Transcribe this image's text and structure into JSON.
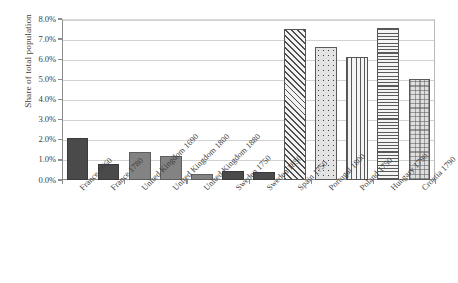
{
  "chart_data": {
    "type": "bar",
    "title": "",
    "xlabel": "",
    "ylabel": "Share of total population",
    "ylim": [
      0,
      8
    ],
    "ytick_labels": [
      "0.0%",
      "1.0%",
      "2.0%",
      "3.0%",
      "4.0%",
      "5.0%",
      "6.0%",
      "7.0%",
      "8.0%"
    ],
    "ytick_values": [
      0,
      1,
      2,
      3,
      4,
      5,
      6,
      7,
      8
    ],
    "grid": true,
    "legend": "none",
    "units": "percent",
    "categories": [
      "France 1660",
      "France 1780",
      "United Kingdom 1690",
      "United Kingdom 1800",
      "United Kingdom 1880",
      "Sweden 1750",
      "Sweden 1850",
      "Spain 1750",
      "Portugal 1800",
      "Poland 1750",
      "Hungary 1790",
      "Croatia 1790"
    ],
    "values": [
      2.1,
      0.8,
      1.4,
      1.2,
      0.3,
      0.45,
      0.4,
      7.5,
      6.6,
      6.1,
      7.55,
      5.0
    ],
    "bar_patterns": [
      "solid-dark-gray",
      "solid-dark-gray",
      "solid-mid-gray",
      "solid-mid-gray",
      "solid-mid-gray",
      "solid-dark-gray",
      "solid-dark-gray",
      "diagonal-hatch",
      "dotted",
      "vertical-lines",
      "horizontal-lines",
      "speckled-dots"
    ],
    "colors": {
      "dark_gray": "#4a4a4a",
      "mid_gray": "#838383",
      "pattern_line": "#5a5a5a",
      "gridline": "#d2d2d2",
      "axis": "#8d8d8d",
      "text": "#3c3c3c",
      "background": "#ffffff"
    }
  }
}
